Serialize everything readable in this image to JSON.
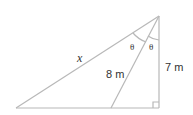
{
  "diagram": {
    "type": "right-triangle-geometry",
    "labels": {
      "hypotenuse": "x",
      "cevian": "8 m",
      "vertical_leg": "7 m",
      "angle_left": "θ",
      "angle_right": "θ"
    },
    "right_angle_marker": true,
    "colors": {
      "line": "#b8b8b8",
      "text": "#333333"
    }
  }
}
